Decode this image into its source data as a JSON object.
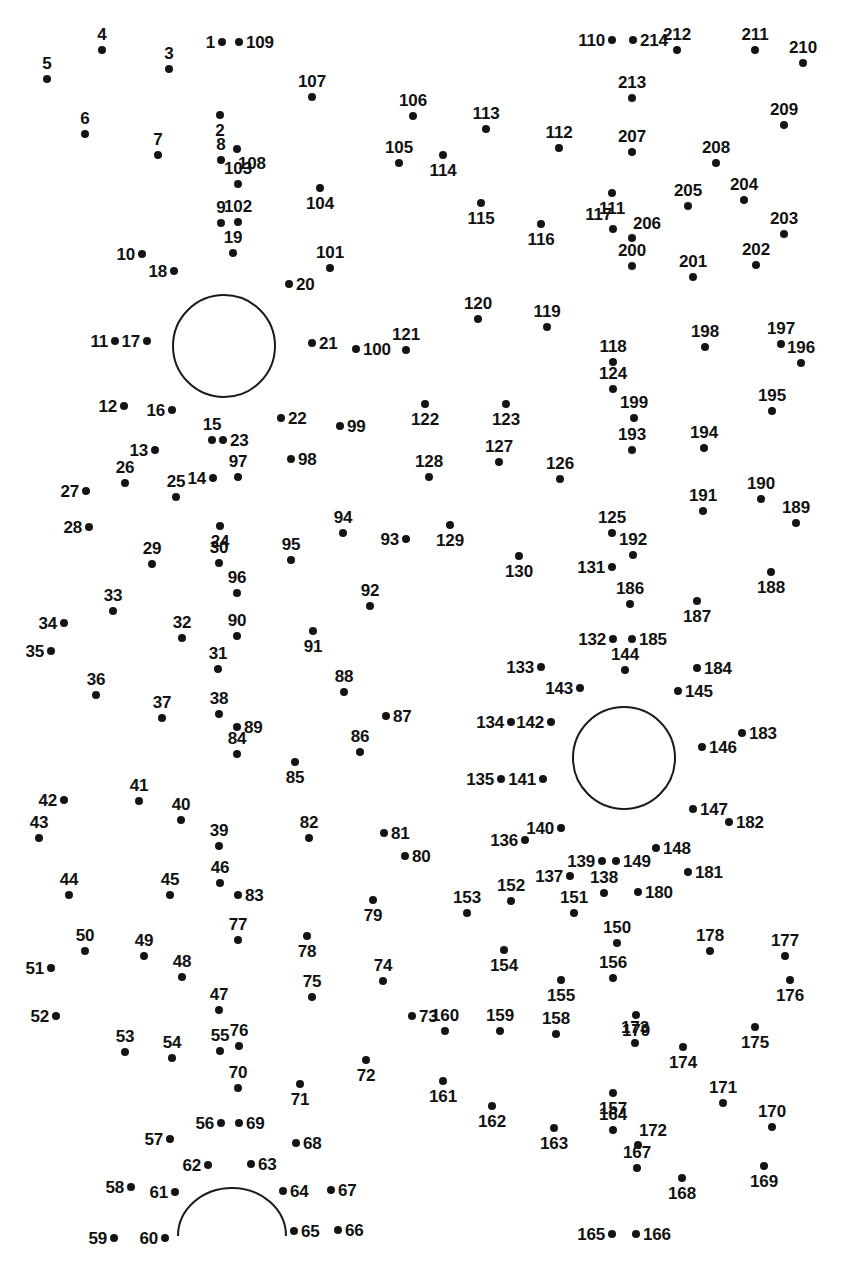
{
  "page": {
    "width": 846,
    "height": 1267,
    "background_color": "#ffffff",
    "dot_color": "#141414",
    "label_color": "#111111",
    "stroke_color": "#1a1a1a",
    "total_dots": 214
  },
  "shapes": [
    {
      "name": "left-eye-circle",
      "type": "circle",
      "cx": 224,
      "cy": 346,
      "r": 51
    },
    {
      "name": "right-eye-circle",
      "type": "circle",
      "cx": 624,
      "cy": 758,
      "r": 51
    },
    {
      "name": "mouth-arc",
      "type": "arc",
      "cx": 232,
      "cy": 1236,
      "rx": 54,
      "ry": 48
    }
  ],
  "dots": [
    {
      "n": "1",
      "x": 222,
      "y": 42,
      "lp": "left"
    },
    {
      "n": "2",
      "x": 220,
      "y": 115,
      "lp": "below"
    },
    {
      "n": "3",
      "x": 169,
      "y": 69,
      "lp": "above"
    },
    {
      "n": "4",
      "x": 102,
      "y": 50,
      "lp": "above"
    },
    {
      "n": "5",
      "x": 47,
      "y": 79,
      "lp": "above"
    },
    {
      "n": "6",
      "x": 85,
      "y": 134,
      "lp": "above"
    },
    {
      "n": "7",
      "x": 158,
      "y": 155,
      "lp": "above"
    },
    {
      "n": "8",
      "x": 221,
      "y": 160,
      "lp": "above"
    },
    {
      "n": "9",
      "x": 221,
      "y": 223,
      "lp": "above"
    },
    {
      "n": "10",
      "x": 142,
      "y": 254,
      "lp": "left"
    },
    {
      "n": "11",
      "x": 115,
      "y": 341,
      "lp": "left"
    },
    {
      "n": "12",
      "x": 124,
      "y": 406,
      "lp": "left"
    },
    {
      "n": "13",
      "x": 155,
      "y": 450,
      "lp": "left"
    },
    {
      "n": "14",
      "x": 213,
      "y": 478,
      "lp": "left"
    },
    {
      "n": "15",
      "x": 212,
      "y": 440,
      "lp": "above"
    },
    {
      "n": "16",
      "x": 172,
      "y": 410,
      "lp": "left"
    },
    {
      "n": "17",
      "x": 147,
      "y": 341,
      "lp": "left"
    },
    {
      "n": "18",
      "x": 174,
      "y": 271,
      "lp": "left"
    },
    {
      "n": "19",
      "x": 233,
      "y": 253,
      "lp": "above"
    },
    {
      "n": "20",
      "x": 289,
      "y": 284,
      "lp": "right"
    },
    {
      "n": "21",
      "x": 312,
      "y": 343,
      "lp": "right"
    },
    {
      "n": "22",
      "x": 281,
      "y": 418,
      "lp": "right"
    },
    {
      "n": "23",
      "x": 223,
      "y": 440,
      "lp": "right"
    },
    {
      "n": "24",
      "x": 220,
      "y": 526,
      "lp": "below"
    },
    {
      "n": "25",
      "x": 176,
      "y": 497,
      "lp": "above"
    },
    {
      "n": "26",
      "x": 125,
      "y": 483,
      "lp": "above"
    },
    {
      "n": "27",
      "x": 86,
      "y": 491,
      "lp": "left"
    },
    {
      "n": "28",
      "x": 89,
      "y": 527,
      "lp": "left"
    },
    {
      "n": "29",
      "x": 152,
      "y": 564,
      "lp": "above"
    },
    {
      "n": "30",
      "x": 219,
      "y": 563,
      "lp": "above"
    },
    {
      "n": "31",
      "x": 218,
      "y": 669,
      "lp": "above"
    },
    {
      "n": "32",
      "x": 182,
      "y": 638,
      "lp": "above"
    },
    {
      "n": "33",
      "x": 113,
      "y": 611,
      "lp": "above"
    },
    {
      "n": "34",
      "x": 64,
      "y": 623,
      "lp": "left"
    },
    {
      "n": "35",
      "x": 51,
      "y": 651,
      "lp": "left"
    },
    {
      "n": "36",
      "x": 96,
      "y": 695,
      "lp": "above"
    },
    {
      "n": "37",
      "x": 162,
      "y": 718,
      "lp": "above"
    },
    {
      "n": "38",
      "x": 219,
      "y": 714,
      "lp": "above"
    },
    {
      "n": "39",
      "x": 219,
      "y": 846,
      "lp": "above"
    },
    {
      "n": "40",
      "x": 181,
      "y": 820,
      "lp": "above"
    },
    {
      "n": "41",
      "x": 139,
      "y": 801,
      "lp": "above"
    },
    {
      "n": "42",
      "x": 64,
      "y": 800,
      "lp": "left"
    },
    {
      "n": "43",
      "x": 39,
      "y": 838,
      "lp": "above"
    },
    {
      "n": "44",
      "x": 69,
      "y": 895,
      "lp": "above"
    },
    {
      "n": "45",
      "x": 170,
      "y": 895,
      "lp": "above"
    },
    {
      "n": "46",
      "x": 220,
      "y": 883,
      "lp": "above"
    },
    {
      "n": "47",
      "x": 219,
      "y": 1010,
      "lp": "above"
    },
    {
      "n": "48",
      "x": 182,
      "y": 977,
      "lp": "above"
    },
    {
      "n": "49",
      "x": 144,
      "y": 956,
      "lp": "above"
    },
    {
      "n": "50",
      "x": 85,
      "y": 951,
      "lp": "above"
    },
    {
      "n": "51",
      "x": 51,
      "y": 968,
      "lp": "left"
    },
    {
      "n": "52",
      "x": 56,
      "y": 1016,
      "lp": "left"
    },
    {
      "n": "53",
      "x": 125,
      "y": 1052,
      "lp": "above"
    },
    {
      "n": "54",
      "x": 172,
      "y": 1058,
      "lp": "above"
    },
    {
      "n": "55",
      "x": 220,
      "y": 1051,
      "lp": "above"
    },
    {
      "n": "56",
      "x": 221,
      "y": 1123,
      "lp": "left"
    },
    {
      "n": "57",
      "x": 170,
      "y": 1139,
      "lp": "left"
    },
    {
      "n": "58",
      "x": 131,
      "y": 1187,
      "lp": "left"
    },
    {
      "n": "59",
      "x": 114,
      "y": 1238,
      "lp": "left"
    },
    {
      "n": "60",
      "x": 165,
      "y": 1238,
      "lp": "left"
    },
    {
      "n": "61",
      "x": 175,
      "y": 1192,
      "lp": "left"
    },
    {
      "n": "62",
      "x": 208,
      "y": 1165,
      "lp": "left"
    },
    {
      "n": "63",
      "x": 251,
      "y": 1164,
      "lp": "right"
    },
    {
      "n": "64",
      "x": 283,
      "y": 1191,
      "lp": "right"
    },
    {
      "n": "65",
      "x": 294,
      "y": 1231,
      "lp": "right"
    },
    {
      "n": "66",
      "x": 338,
      "y": 1230,
      "lp": "right"
    },
    {
      "n": "67",
      "x": 331,
      "y": 1190,
      "lp": "right"
    },
    {
      "n": "68",
      "x": 296,
      "y": 1143,
      "lp": "right"
    },
    {
      "n": "69",
      "x": 239,
      "y": 1123,
      "lp": "right"
    },
    {
      "n": "70",
      "x": 238,
      "y": 1088,
      "lp": "above"
    },
    {
      "n": "71",
      "x": 300,
      "y": 1084,
      "lp": "below"
    },
    {
      "n": "72",
      "x": 366,
      "y": 1060,
      "lp": "below"
    },
    {
      "n": "73",
      "x": 412,
      "y": 1016,
      "lp": "right"
    },
    {
      "n": "74",
      "x": 383,
      "y": 981,
      "lp": "above"
    },
    {
      "n": "75",
      "x": 312,
      "y": 997,
      "lp": "above"
    },
    {
      "n": "76",
      "x": 239,
      "y": 1046,
      "lp": "above"
    },
    {
      "n": "77",
      "x": 238,
      "y": 940,
      "lp": "above"
    },
    {
      "n": "78",
      "x": 307,
      "y": 936,
      "lp": "below"
    },
    {
      "n": "79",
      "x": 373,
      "y": 900,
      "lp": "below"
    },
    {
      "n": "80",
      "x": 405,
      "y": 856,
      "lp": "right"
    },
    {
      "n": "81",
      "x": 384,
      "y": 833,
      "lp": "right"
    },
    {
      "n": "82",
      "x": 309,
      "y": 838,
      "lp": "above"
    },
    {
      "n": "83",
      "x": 238,
      "y": 895,
      "lp": "right"
    },
    {
      "n": "84",
      "x": 237,
      "y": 754,
      "lp": "above"
    },
    {
      "n": "85",
      "x": 295,
      "y": 762,
      "lp": "below"
    },
    {
      "n": "86",
      "x": 360,
      "y": 752,
      "lp": "above"
    },
    {
      "n": "87",
      "x": 386,
      "y": 716,
      "lp": "right"
    },
    {
      "n": "88",
      "x": 344,
      "y": 692,
      "lp": "above"
    },
    {
      "n": "89",
      "x": 237,
      "y": 727,
      "lp": "right"
    },
    {
      "n": "90",
      "x": 237,
      "y": 636,
      "lp": "above"
    },
    {
      "n": "91",
      "x": 313,
      "y": 631,
      "lp": "below"
    },
    {
      "n": "92",
      "x": 370,
      "y": 606,
      "lp": "above"
    },
    {
      "n": "93",
      "x": 406,
      "y": 539,
      "lp": "left"
    },
    {
      "n": "94",
      "x": 343,
      "y": 533,
      "lp": "above"
    },
    {
      "n": "95",
      "x": 291,
      "y": 560,
      "lp": "above"
    },
    {
      "n": "96",
      "x": 237,
      "y": 593,
      "lp": "above"
    },
    {
      "n": "97",
      "x": 238,
      "y": 477,
      "lp": "above"
    },
    {
      "n": "98",
      "x": 291,
      "y": 459,
      "lp": "right"
    },
    {
      "n": "99",
      "x": 340,
      "y": 426,
      "lp": "right"
    },
    {
      "n": "100",
      "x": 356,
      "y": 349,
      "lp": "right"
    },
    {
      "n": "101",
      "x": 330,
      "y": 268,
      "lp": "above"
    },
    {
      "n": "102",
      "x": 238,
      "y": 222,
      "lp": "above"
    },
    {
      "n": "103",
      "x": 238,
      "y": 184,
      "lp": "above"
    },
    {
      "n": "104",
      "x": 320,
      "y": 188,
      "lp": "below"
    },
    {
      "n": "105",
      "x": 399,
      "y": 163,
      "lp": "above"
    },
    {
      "n": "106",
      "x": 413,
      "y": 116,
      "lp": "above"
    },
    {
      "n": "107",
      "x": 312,
      "y": 97,
      "lp": "above"
    },
    {
      "n": "108",
      "x": 237,
      "y": 149,
      "lp": "below-right"
    },
    {
      "n": "109",
      "x": 239,
      "y": 42,
      "lp": "right"
    },
    {
      "n": "110",
      "x": 612,
      "y": 40,
      "lp": "left"
    },
    {
      "n": "111",
      "x": 612,
      "y": 193,
      "lp": "below"
    },
    {
      "n": "112",
      "x": 559,
      "y": 148,
      "lp": "above"
    },
    {
      "n": "113",
      "x": 486,
      "y": 129,
      "lp": "above"
    },
    {
      "n": "114",
      "x": 443,
      "y": 155,
      "lp": "below"
    },
    {
      "n": "115",
      "x": 481,
      "y": 203,
      "lp": "below"
    },
    {
      "n": "116",
      "x": 541,
      "y": 224,
      "lp": "below"
    },
    {
      "n": "117",
      "x": 613,
      "y": 229,
      "lp": "above-left"
    },
    {
      "n": "118",
      "x": 613,
      "y": 362,
      "lp": "above"
    },
    {
      "n": "119",
      "x": 547,
      "y": 327,
      "lp": "above"
    },
    {
      "n": "120",
      "x": 478,
      "y": 319,
      "lp": "above"
    },
    {
      "n": "121",
      "x": 406,
      "y": 350,
      "lp": "above"
    },
    {
      "n": "122",
      "x": 425,
      "y": 404,
      "lp": "below"
    },
    {
      "n": "123",
      "x": 506,
      "y": 404,
      "lp": "below"
    },
    {
      "n": "124",
      "x": 613,
      "y": 389,
      "lp": "above"
    },
    {
      "n": "125",
      "x": 612,
      "y": 533,
      "lp": "above"
    },
    {
      "n": "126",
      "x": 560,
      "y": 479,
      "lp": "above"
    },
    {
      "n": "127",
      "x": 499,
      "y": 462,
      "lp": "above"
    },
    {
      "n": "128",
      "x": 429,
      "y": 477,
      "lp": "above"
    },
    {
      "n": "129",
      "x": 450,
      "y": 525,
      "lp": "below"
    },
    {
      "n": "130",
      "x": 519,
      "y": 556,
      "lp": "below"
    },
    {
      "n": "131",
      "x": 612,
      "y": 567,
      "lp": "left"
    },
    {
      "n": "132",
      "x": 613,
      "y": 639,
      "lp": "left"
    },
    {
      "n": "133",
      "x": 541,
      "y": 667,
      "lp": "left"
    },
    {
      "n": "134",
      "x": 511,
      "y": 722,
      "lp": "left"
    },
    {
      "n": "135",
      "x": 501,
      "y": 779,
      "lp": "left"
    },
    {
      "n": "136",
      "x": 525,
      "y": 840,
      "lp": "left"
    },
    {
      "n": "137",
      "x": 570,
      "y": 876,
      "lp": "left"
    },
    {
      "n": "138",
      "x": 604,
      "y": 893,
      "lp": "above"
    },
    {
      "n": "139",
      "x": 602,
      "y": 861,
      "lp": "left"
    },
    {
      "n": "140",
      "x": 561,
      "y": 828,
      "lp": "left"
    },
    {
      "n": "141",
      "x": 543,
      "y": 779,
      "lp": "left"
    },
    {
      "n": "142",
      "x": 551,
      "y": 722,
      "lp": "left"
    },
    {
      "n": "143",
      "x": 580,
      "y": 688,
      "lp": "left"
    },
    {
      "n": "144",
      "x": 625,
      "y": 670,
      "lp": "above"
    },
    {
      "n": "145",
      "x": 678,
      "y": 691,
      "lp": "right"
    },
    {
      "n": "146",
      "x": 702,
      "y": 747,
      "lp": "right"
    },
    {
      "n": "147",
      "x": 693,
      "y": 809,
      "lp": "right"
    },
    {
      "n": "148",
      "x": 656,
      "y": 848,
      "lp": "right"
    },
    {
      "n": "149",
      "x": 616,
      "y": 861,
      "lp": "right"
    },
    {
      "n": "150",
      "x": 617,
      "y": 943,
      "lp": "above"
    },
    {
      "n": "151",
      "x": 574,
      "y": 913,
      "lp": "above"
    },
    {
      "n": "152",
      "x": 511,
      "y": 901,
      "lp": "above"
    },
    {
      "n": "153",
      "x": 467,
      "y": 913,
      "lp": "above"
    },
    {
      "n": "154",
      "x": 504,
      "y": 950,
      "lp": "below"
    },
    {
      "n": "155",
      "x": 561,
      "y": 980,
      "lp": "below"
    },
    {
      "n": "156",
      "x": 613,
      "y": 978,
      "lp": "above"
    },
    {
      "n": "157",
      "x": 613,
      "y": 1093,
      "lp": "below"
    },
    {
      "n": "158",
      "x": 556,
      "y": 1034,
      "lp": "above"
    },
    {
      "n": "159",
      "x": 500,
      "y": 1031,
      "lp": "above"
    },
    {
      "n": "160",
      "x": 445,
      "y": 1031,
      "lp": "above"
    },
    {
      "n": "161",
      "x": 443,
      "y": 1081,
      "lp": "below"
    },
    {
      "n": "162",
      "x": 492,
      "y": 1106,
      "lp": "below"
    },
    {
      "n": "163",
      "x": 554,
      "y": 1128,
      "lp": "below"
    },
    {
      "n": "164",
      "x": 613,
      "y": 1130,
      "lp": "above"
    },
    {
      "n": "165",
      "x": 612,
      "y": 1234,
      "lp": "left"
    },
    {
      "n": "166",
      "x": 636,
      "y": 1234,
      "lp": "right"
    },
    {
      "n": "167",
      "x": 637,
      "y": 1168,
      "lp": "above"
    },
    {
      "n": "168",
      "x": 682,
      "y": 1178,
      "lp": "below"
    },
    {
      "n": "169",
      "x": 764,
      "y": 1166,
      "lp": "below"
    },
    {
      "n": "170",
      "x": 772,
      "y": 1127,
      "lp": "above"
    },
    {
      "n": "171",
      "x": 723,
      "y": 1103,
      "lp": "above"
    },
    {
      "n": "172",
      "x": 638,
      "y": 1145,
      "lp": "above-right"
    },
    {
      "n": "173",
      "x": 635,
      "y": 1043,
      "lp": "above"
    },
    {
      "n": "174",
      "x": 683,
      "y": 1047,
      "lp": "below"
    },
    {
      "n": "175",
      "x": 755,
      "y": 1027,
      "lp": "below"
    },
    {
      "n": "176",
      "x": 790,
      "y": 980,
      "lp": "below"
    },
    {
      "n": "177",
      "x": 785,
      "y": 956,
      "lp": "above"
    },
    {
      "n": "178",
      "x": 710,
      "y": 951,
      "lp": "above"
    },
    {
      "n": "179",
      "x": 636,
      "y": 1015,
      "lp": "below"
    },
    {
      "n": "180",
      "x": 638,
      "y": 892,
      "lp": "right"
    },
    {
      "n": "181",
      "x": 688,
      "y": 872,
      "lp": "right"
    },
    {
      "n": "182",
      "x": 729,
      "y": 822,
      "lp": "right"
    },
    {
      "n": "183",
      "x": 742,
      "y": 733,
      "lp": "right"
    },
    {
      "n": "184",
      "x": 697,
      "y": 668,
      "lp": "right"
    },
    {
      "n": "185",
      "x": 632,
      "y": 639,
      "lp": "right"
    },
    {
      "n": "186",
      "x": 630,
      "y": 604,
      "lp": "above"
    },
    {
      "n": "187",
      "x": 697,
      "y": 601,
      "lp": "below"
    },
    {
      "n": "188",
      "x": 771,
      "y": 572,
      "lp": "below"
    },
    {
      "n": "189",
      "x": 796,
      "y": 523,
      "lp": "above"
    },
    {
      "n": "190",
      "x": 761,
      "y": 499,
      "lp": "above"
    },
    {
      "n": "191",
      "x": 703,
      "y": 511,
      "lp": "above"
    },
    {
      "n": "192",
      "x": 633,
      "y": 555,
      "lp": "above"
    },
    {
      "n": "193",
      "x": 632,
      "y": 450,
      "lp": "above"
    },
    {
      "n": "194",
      "x": 704,
      "y": 448,
      "lp": "above"
    },
    {
      "n": "195",
      "x": 772,
      "y": 411,
      "lp": "above"
    },
    {
      "n": "196",
      "x": 801,
      "y": 363,
      "lp": "above"
    },
    {
      "n": "197",
      "x": 781,
      "y": 344,
      "lp": "above"
    },
    {
      "n": "198",
      "x": 705,
      "y": 347,
      "lp": "above"
    },
    {
      "n": "199",
      "x": 634,
      "y": 418,
      "lp": "above"
    },
    {
      "n": "200",
      "x": 632,
      "y": 266,
      "lp": "above"
    },
    {
      "n": "201",
      "x": 693,
      "y": 277,
      "lp": "above"
    },
    {
      "n": "202",
      "x": 756,
      "y": 265,
      "lp": "above"
    },
    {
      "n": "203",
      "x": 784,
      "y": 234,
      "lp": "above"
    },
    {
      "n": "204",
      "x": 744,
      "y": 200,
      "lp": "above"
    },
    {
      "n": "205",
      "x": 688,
      "y": 206,
      "lp": "above"
    },
    {
      "n": "206",
      "x": 632,
      "y": 238,
      "lp": "above-right"
    },
    {
      "n": "207",
      "x": 632,
      "y": 152,
      "lp": "above"
    },
    {
      "n": "208",
      "x": 716,
      "y": 163,
      "lp": "above"
    },
    {
      "n": "209",
      "x": 784,
      "y": 125,
      "lp": "above"
    },
    {
      "n": "210",
      "x": 803,
      "y": 63,
      "lp": "above"
    },
    {
      "n": "211",
      "x": 755,
      "y": 50,
      "lp": "above"
    },
    {
      "n": "212",
      "x": 677,
      "y": 50,
      "lp": "above"
    },
    {
      "n": "213",
      "x": 632,
      "y": 98,
      "lp": "above"
    },
    {
      "n": "214",
      "x": 633,
      "y": 40,
      "lp": "right"
    }
  ]
}
